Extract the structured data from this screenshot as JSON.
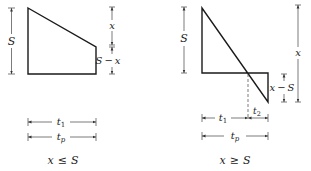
{
  "diagrams": [
    {
      "id": "left",
      "condition": "x ≤ S",
      "condition_parts": {
        "lhs": "x",
        "op": "≤",
        "rhs": "S"
      },
      "labels": {
        "height": "S",
        "top_drop": "x",
        "remaining_height_lhs": "S",
        "remaining_height_op": "−",
        "remaining_height_rhs": "x",
        "t1": "t",
        "t1_sub": "1",
        "tp": "t",
        "tp_sub": "p"
      }
    },
    {
      "id": "right",
      "condition": "x ≥ S",
      "condition_parts": {
        "lhs": "x",
        "op": "≥",
        "rhs": "S"
      },
      "labels": {
        "height": "S",
        "total_drop": "x",
        "below_lhs": "x",
        "below_op": "−",
        "below_rhs": "S",
        "t1": "t",
        "t1_sub": "1",
        "t2": "t",
        "t2_sub": "2",
        "tp": "t",
        "tp_sub": "p"
      }
    }
  ],
  "colors": {
    "line": "#1a1a1a",
    "dim": "#444444"
  }
}
